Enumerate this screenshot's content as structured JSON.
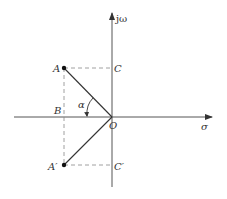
{
  "diagram": {
    "type": "s-plane pole diagram",
    "axes": {
      "vertical_label": "jω",
      "horizontal_label": "σ"
    },
    "points": {
      "origin": "O",
      "A": "A",
      "A_conj": "A′",
      "B": "B",
      "C": "C",
      "C_conj": "C′"
    },
    "angle_label": "α",
    "colors": {
      "line": "#333333",
      "dashed": "#888888",
      "background": "#ffffff"
    }
  }
}
